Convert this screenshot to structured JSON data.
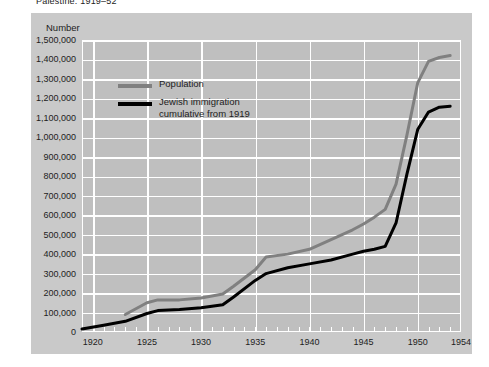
{
  "title": "Palestine: 1919–52",
  "panel": {
    "background": "#c9c9c9",
    "plot_background": "#bfbfbf",
    "grid_color": "#ffffff"
  },
  "axis": {
    "y_label": "Number",
    "y_ticks": [
      "0",
      "100,000",
      "200,000",
      "300,000",
      "400,000",
      "500,000",
      "600,000",
      "700,000",
      "800,000",
      "900,000",
      "1,000,000",
      "1,100,000",
      "1,200,000",
      "1,300,000",
      "1,400,000",
      "1,500,000"
    ],
    "x_ticks": [
      "1920",
      "1925",
      "1930",
      "1935",
      "1940",
      "1945",
      "1950",
      "1954"
    ]
  },
  "legend": {
    "items": [
      {
        "label": "Population",
        "label2": "",
        "color": "#808080"
      },
      {
        "label": "Jewish immigration",
        "label2": "cumulative from 1919",
        "color": "#000000"
      }
    ]
  },
  "chart_data": {
    "type": "line",
    "title": "Palestine: 1919–52",
    "xlabel": "",
    "ylabel": "Number",
    "xlim": [
      1919,
      1954
    ],
    "ylim": [
      0,
      1500000
    ],
    "ytick_step": 100000,
    "grid": true,
    "legend_position": "inside-upper-left",
    "series": [
      {
        "name": "Population",
        "color": "#808080",
        "x": [
          1923,
          1925,
          1926,
          1928,
          1930,
          1932,
          1933,
          1935,
          1936,
          1938,
          1940,
          1942,
          1944,
          1945,
          1946,
          1947,
          1948,
          1949,
          1950,
          1951,
          1952,
          1953
        ],
        "values": [
          90000,
          150000,
          165000,
          165000,
          175000,
          195000,
          235000,
          320000,
          385000,
          400000,
          425000,
          475000,
          525000,
          555000,
          590000,
          630000,
          760000,
          1010000,
          1280000,
          1390000,
          1410000,
          1420000
        ]
      },
      {
        "name": "Jewish immigration cumulative from 1919",
        "color": "#000000",
        "x": [
          1919,
          1921,
          1923,
          1925,
          1926,
          1928,
          1930,
          1932,
          1933,
          1935,
          1936,
          1938,
          1940,
          1942,
          1944,
          1945,
          1946,
          1947,
          1948,
          1949,
          1950,
          1951,
          1952,
          1953
        ],
        "values": [
          15000,
          35000,
          55000,
          95000,
          110000,
          115000,
          125000,
          140000,
          180000,
          265000,
          300000,
          330000,
          350000,
          370000,
          400000,
          415000,
          425000,
          440000,
          560000,
          810000,
          1040000,
          1130000,
          1155000,
          1160000
        ]
      }
    ]
  }
}
